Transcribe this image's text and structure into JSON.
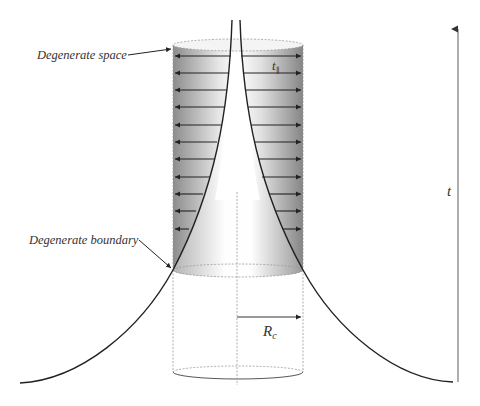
{
  "diagram": {
    "labels": {
      "degenerate_space": "Degenerate space",
      "degenerate_boundary": "Degenerate boundary",
      "t_parallel_base": "t",
      "t_parallel_sub": "∥",
      "radius_base": "R",
      "radius_sub": "c",
      "time_axis": "t"
    },
    "arrow_rows": 11,
    "colors": {
      "line": "#222222",
      "dashed": "#9a9a9a",
      "shade_dark": "#8a8a8a",
      "shade_light": "#ffffff",
      "axis": "#777777"
    }
  }
}
